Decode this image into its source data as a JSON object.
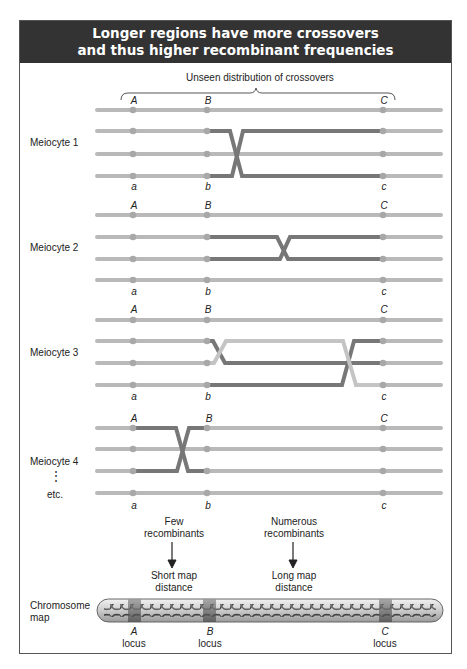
{
  "header": {
    "title_line1": "Longer regions have more crossovers",
    "title_line2": "and thus higher recombinant frequencies"
  },
  "brace_label": "Unseen distribution of crossovers",
  "alleles": {
    "upper": [
      "A",
      "B",
      "C"
    ],
    "lower": [
      "a",
      "b",
      "c"
    ]
  },
  "meiocytes": [
    {
      "label": "Meiocyte 1",
      "crossovers": [
        {
          "between": "B-C",
          "chromatids": [
            2,
            4
          ]
        }
      ]
    },
    {
      "label": "Meiocyte 2",
      "crossovers": [
        {
          "between": "B-C",
          "chromatids": [
            2,
            3
          ]
        }
      ]
    },
    {
      "label": "Meiocyte 3",
      "crossovers": [
        {
          "between": "B-C",
          "chromatids": [
            2,
            3
          ]
        },
        {
          "between": "B-C",
          "chromatids": [
            2,
            4
          ]
        }
      ]
    },
    {
      "label": "Meiocyte 4",
      "crossovers": [
        {
          "between": "A-B",
          "chromatids": [
            1,
            3
          ]
        }
      ]
    }
  ],
  "ellipsis": "⋮",
  "etc_label": "etc.",
  "annotations": {
    "few_line1": "Few",
    "few_line2": "recombinants",
    "short_line1": "Short map",
    "short_line2": "distance",
    "numerous_line1": "Numerous",
    "numerous_line2": "recombinants",
    "long_line1": "Long map",
    "long_line2": "distance"
  },
  "chromosome_map": {
    "label_line1": "Chromosome",
    "label_line2": "map",
    "loci": [
      {
        "letter": "A",
        "word": "locus"
      },
      {
        "letter": "B",
        "word": "locus"
      },
      {
        "letter": "C",
        "word": "locus"
      }
    ]
  },
  "colors": {
    "header_bg": "#333333",
    "chromatid_light": "#b9b9b9",
    "chromatid_dark": "#777777",
    "centromere_dot": "#a8a8a8"
  }
}
